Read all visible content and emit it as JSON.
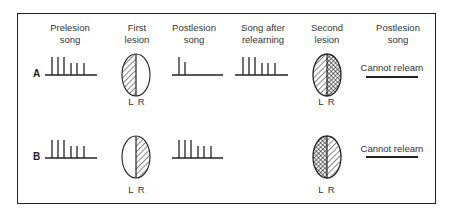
{
  "figure": {
    "columns": [
      {
        "id": "prelesion",
        "label_line1": "Prelesion",
        "label_line2": "song",
        "center_x": 70
      },
      {
        "id": "first_lesion",
        "label_line1": "First",
        "label_line2": "lesion",
        "center_x": 137
      },
      {
        "id": "postlesion1",
        "label_line1": "Postlesion",
        "label_line2": "song",
        "center_x": 194
      },
      {
        "id": "relearning",
        "label_line1": "Song after",
        "label_line2": "relearning",
        "center_x": 263
      },
      {
        "id": "second_lesion",
        "label_line1": "Second",
        "label_line2": "lesion",
        "center_x": 327
      },
      {
        "id": "postlesion2",
        "label_line1": "Postlesion",
        "label_line2": "song",
        "center_x": 398
      }
    ],
    "rows": [
      {
        "label": "A",
        "prelesion_song": {
          "syllables": [
            18,
            18,
            18,
            12,
            12,
            12
          ]
        },
        "first_lesion": {
          "lesioned_side": "L",
          "pattern": "hatched"
        },
        "brain_labels": "L R",
        "postlesion_song": {
          "syllables": [
            18,
            13
          ]
        },
        "song_after_relearning": {
          "syllables": [
            18,
            18,
            18,
            12,
            12,
            12
          ]
        },
        "second_lesion": {
          "left": "hatched",
          "right": "crosshatched"
        },
        "final_outcome": "Cannot relearn"
      },
      {
        "label": "B",
        "prelesion_song": {
          "syllables": [
            18,
            18,
            18,
            12,
            12,
            12
          ]
        },
        "first_lesion": {
          "lesioned_side": "R",
          "pattern": "hatched"
        },
        "brain_labels": "L R",
        "postlesion_song": {
          "syllables": [
            18,
            18,
            18,
            12,
            12,
            12
          ]
        },
        "song_after_relearning": null,
        "second_lesion": {
          "left": "crosshatched",
          "right": "hatched"
        },
        "final_outcome": "Cannot relearn"
      }
    ],
    "colors": {
      "ink": "#222222",
      "background": "#ffffff"
    }
  }
}
